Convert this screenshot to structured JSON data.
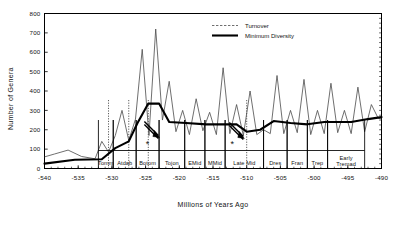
{
  "chart_data": {
    "type": "line",
    "title": "",
    "xlabel": "Millions of Years Ago",
    "ylabel": "Number of Genera",
    "xlim": [
      -540,
      -490
    ],
    "ylim": [
      0,
      800
    ],
    "xticks": [
      "-540",
      "-535",
      "-530",
      "-525",
      "-520",
      "-515",
      "-510",
      "-505",
      "-500",
      "-495",
      "-490"
    ],
    "yticks": [
      "0",
      "100",
      "200",
      "300",
      "400",
      "500",
      "600",
      "700",
      "800"
    ],
    "grid": false,
    "legend_position": "top-right",
    "legend": [
      "Turnover",
      "Minimum Diversity"
    ],
    "series": [
      {
        "name": "Turnover",
        "style": "thin",
        "x": [
          -540,
          -538.5,
          -536.5,
          -534.5,
          -532.5,
          -531.5,
          -530.5,
          -529.5,
          -528.5,
          -527.5,
          -526.5,
          -525.5,
          -524.5,
          -523.5,
          -522.5,
          -521.5,
          -520.5,
          -519.5,
          -518.5,
          -517.5,
          -516.5,
          -515.5,
          -514.5,
          -513.5,
          -512.5,
          -511.5,
          -510.5,
          -509.5,
          -508.5,
          -507.5,
          -506.5,
          -505.5,
          -504.5,
          -503.5,
          -502.5,
          -501.5,
          -500.5,
          -499.5,
          -498.5,
          -497.5,
          -496.5,
          -495.5,
          -494.5,
          -493.5,
          -492.5,
          -491.5,
          -490.5,
          -490
        ],
        "y": [
          60,
          75,
          95,
          62,
          50,
          140,
          85,
          170,
          300,
          145,
          255,
          615,
          170,
          720,
          250,
          450,
          190,
          300,
          175,
          360,
          195,
          290,
          175,
          520,
          180,
          330,
          170,
          400,
          175,
          200,
          180,
          480,
          180,
          300,
          185,
          460,
          175,
          300,
          180,
          440,
          185,
          300,
          180,
          420,
          190,
          330,
          260,
          255
        ]
      },
      {
        "name": "Minimum Diversity",
        "style": "thick",
        "x": [
          -540,
          -535.5,
          -531.5,
          -529.5,
          -527.5,
          -526.2,
          -524.6,
          -523.0,
          -521.5,
          -519.0,
          -516.0,
          -513.5,
          -511.5,
          -510.0,
          -508.0,
          -506.0,
          -503.5,
          -501.0,
          -498.5,
          -496.0,
          -494.5,
          -492.0,
          -490
        ],
        "y": [
          25,
          45,
          48,
          105,
          140,
          235,
          335,
          335,
          240,
          235,
          228,
          228,
          228,
          190,
          200,
          245,
          235,
          228,
          240,
          240,
          240,
          255,
          265
        ]
      }
    ],
    "stages": [
      {
        "label": "Tomm",
        "x0": -532.0,
        "x1": -529.8
      },
      {
        "label": "Atdab",
        "x0": -529.8,
        "x1": -526.4
      },
      {
        "label": "Botom",
        "x0": -526.4,
        "x1": -523.0
      },
      {
        "label": "Tojon",
        "x0": -523.0,
        "x1": -519.2
      },
      {
        "label": "EMid",
        "x0": -519.2,
        "x1": -516.2
      },
      {
        "label": "MMid",
        "x0": -516.2,
        "x1": -513.2
      },
      {
        "label": "Late Mid",
        "x0": -513.2,
        "x1": -507.5
      },
      {
        "label": "Dres",
        "x0": -507.5,
        "x1": -504.0
      },
      {
        "label": "Fran",
        "x0": -504.0,
        "x1": -501.0
      },
      {
        "label": "Trep",
        "x0": -501.0,
        "x1": -498.0
      },
      {
        "label": "Early Tremad",
        "x0": -498.0,
        "x1": -492.5
      }
    ],
    "annotations": [
      {
        "name": "extinction-arrow-botom",
        "marker": "*",
        "x": -523.4,
        "y": 160
      },
      {
        "name": "extinction-arrow-latemid",
        "marker": "*",
        "x": -510.8,
        "y": 155
      }
    ],
    "droppers": [
      {
        "x": -530.5
      },
      {
        "x": -527.5
      },
      {
        "x": -524.6
      },
      {
        "x": -510.0
      }
    ],
    "colors": {
      "turnover_line": "#4a4a4a",
      "minimum_diversity_line": "#000000",
      "axis": "#000000",
      "background": "#ffffff"
    }
  }
}
